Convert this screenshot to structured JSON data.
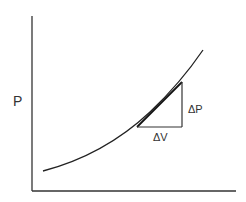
{
  "diagram": {
    "type": "pressure-volume curve with tangent slope triangle",
    "y_axis_label": "P",
    "x_axis_label": "",
    "delta_p_label": "ΔP",
    "delta_v_label": "ΔV",
    "colors": {
      "line": "#222222",
      "text": "#333333",
      "background": "#ffffff"
    }
  }
}
